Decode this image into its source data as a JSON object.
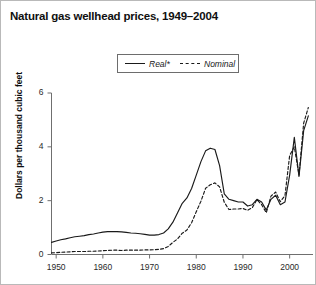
{
  "figure": {
    "title": "Natural gas wellhead prices, 1949–2004",
    "border_color": "#b9b9b9",
    "background": "#ffffff"
  },
  "legend": {
    "position": "top-center",
    "entries": [
      {
        "label": "Real*",
        "style": "solid",
        "color": "#1a1a1a"
      },
      {
        "label": "Nominal",
        "style": "dashed",
        "color": "#1a1a1a"
      }
    ]
  },
  "axes": {
    "y_title": "Dollars per thousand cubic feet",
    "y_ticks": [
      "0",
      "2",
      "4",
      "6"
    ],
    "x_ticks": [
      "1950",
      "1960",
      "1970",
      "1980",
      "1990",
      "2000"
    ]
  },
  "chart_data": {
    "type": "line",
    "title": "Natural gas wellhead prices, 1949–2004",
    "xlabel": "",
    "ylabel": "Dollars per thousand cubic feet",
    "xlim": [
      1949,
      2005
    ],
    "ylim": [
      0,
      6
    ],
    "xticks": [
      1950,
      1960,
      1970,
      1980,
      1990,
      2000
    ],
    "yticks": [
      0,
      2,
      4,
      6
    ],
    "grid": false,
    "legend_position": "top-center",
    "footnote_marker": "*",
    "x": [
      1949,
      1950,
      1951,
      1952,
      1953,
      1954,
      1955,
      1956,
      1957,
      1958,
      1959,
      1960,
      1961,
      1962,
      1963,
      1964,
      1965,
      1966,
      1967,
      1968,
      1969,
      1970,
      1971,
      1972,
      1973,
      1974,
      1975,
      1976,
      1977,
      1978,
      1979,
      1980,
      1981,
      1982,
      1983,
      1984,
      1985,
      1986,
      1987,
      1988,
      1989,
      1990,
      1991,
      1992,
      1993,
      1994,
      1995,
      1996,
      1997,
      1998,
      1999,
      2000,
      2001,
      2002,
      2003,
      2004
    ],
    "series": [
      {
        "name": "Real*",
        "style": "solid",
        "color": "#1a1a1a",
        "values": [
          0.45,
          0.5,
          0.55,
          0.58,
          0.62,
          0.66,
          0.68,
          0.7,
          0.74,
          0.76,
          0.8,
          0.83,
          0.85,
          0.85,
          0.85,
          0.84,
          0.82,
          0.8,
          0.79,
          0.77,
          0.75,
          0.72,
          0.72,
          0.74,
          0.8,
          0.95,
          1.2,
          1.55,
          1.9,
          2.1,
          2.45,
          2.95,
          3.45,
          3.85,
          3.95,
          3.9,
          3.3,
          2.25,
          2.05,
          2.0,
          1.95,
          1.95,
          1.8,
          1.85,
          2.05,
          1.95,
          1.65,
          2.05,
          2.2,
          1.85,
          1.95,
          2.95,
          4.35,
          2.9,
          4.6,
          5.15
        ]
      },
      {
        "name": "Nominal",
        "style": "dashed",
        "color": "#1a1a1a",
        "values": [
          0.06,
          0.07,
          0.08,
          0.09,
          0.1,
          0.11,
          0.11,
          0.11,
          0.12,
          0.12,
          0.13,
          0.14,
          0.15,
          0.16,
          0.16,
          0.15,
          0.16,
          0.16,
          0.16,
          0.16,
          0.17,
          0.17,
          0.18,
          0.19,
          0.22,
          0.3,
          0.45,
          0.58,
          0.79,
          0.91,
          1.18,
          1.59,
          1.98,
          2.46,
          2.59,
          2.66,
          2.51,
          1.94,
          1.67,
          1.69,
          1.69,
          1.71,
          1.64,
          1.74,
          2.04,
          1.85,
          1.55,
          2.17,
          2.32,
          1.96,
          2.19,
          3.68,
          4.0,
          2.95,
          4.88,
          5.46
        ]
      }
    ]
  }
}
